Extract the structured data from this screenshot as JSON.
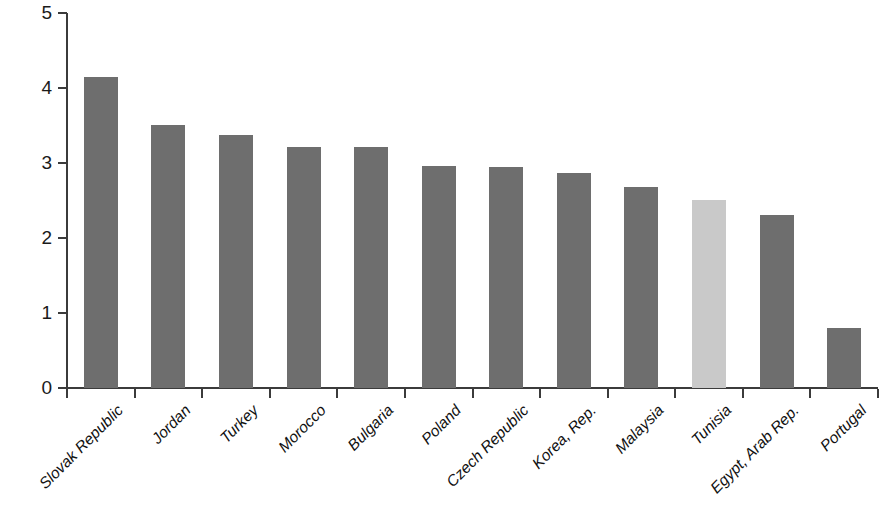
{
  "chart_data": {
    "type": "bar",
    "title": "",
    "subtitle": "",
    "xlabel": "",
    "ylabel": "",
    "ylim": [
      0,
      5
    ],
    "ytick_labels": [
      "0",
      "1",
      "2",
      "3",
      "4",
      "5"
    ],
    "ytick_values": [
      0,
      1,
      2,
      3,
      4,
      5
    ],
    "grid": false,
    "legend": false,
    "legend_position": "none",
    "categories": [
      "Slovak Republic",
      "Jordan",
      "Turkey",
      "Morocco",
      "Bulgaria",
      "Poland",
      "Czech Republic",
      "Korea, Rep.",
      "Malaysia",
      "Tunisia",
      "Egypt, Arab Rep.",
      "Portugal"
    ],
    "values": [
      4.15,
      3.51,
      3.37,
      3.22,
      3.22,
      2.96,
      2.95,
      2.87,
      2.68,
      2.51,
      2.31,
      0.8
    ],
    "highlight_index": 9,
    "colors": {
      "bar": "#6e6e6e",
      "bar_highlight": "#c9c9c9",
      "axis": "#3b3b3b",
      "text": "#111111",
      "background": "#ffffff"
    }
  }
}
